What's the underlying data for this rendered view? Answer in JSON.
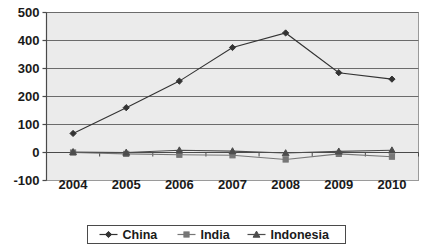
{
  "chart_data": {
    "type": "line",
    "title": "",
    "subtitle": "",
    "xlabel": "",
    "ylabel": "",
    "categories": [
      "2004",
      "2005",
      "2006",
      "2007",
      "2008",
      "2009",
      "2010"
    ],
    "x": [
      2004,
      2005,
      2006,
      2007,
      2008,
      2009,
      2010
    ],
    "ylim": [
      -100,
      500
    ],
    "yticks": [
      -100,
      0,
      100,
      200,
      300,
      400,
      500
    ],
    "ytick_labels": [
      "-100",
      "0",
      "100",
      "200",
      "300",
      "400",
      "500"
    ],
    "grid": true,
    "grid_axis": "y",
    "legend_position": "bottom",
    "series": [
      {
        "name": "China",
        "marker": "diamond",
        "color": "#333333",
        "values": [
          68,
          160,
          255,
          375,
          427,
          285,
          262
        ]
      },
      {
        "name": "India",
        "marker": "square",
        "color": "#777777",
        "values": [
          0,
          -5,
          -8,
          -10,
          -25,
          -5,
          -15
        ]
      },
      {
        "name": "Indonesia",
        "marker": "triangle",
        "color": "#4d4d4d",
        "values": [
          2,
          0,
          8,
          5,
          -2,
          4,
          8
        ]
      }
    ]
  },
  "style": {
    "plot_background": "#ebebeb",
    "plot_border": "#9a9a9a",
    "gridline_color": "#6b6b6b",
    "axis_color": "#4a4a4a",
    "legend_border": "#4a4a4a",
    "legend_background": "#ffffff",
    "page_background": "#ffffff"
  },
  "legend": {
    "entries": [
      {
        "label": "China",
        "marker": "diamond"
      },
      {
        "label": "India",
        "marker": "square"
      },
      {
        "label": "Indonesia",
        "marker": "triangle"
      }
    ]
  }
}
